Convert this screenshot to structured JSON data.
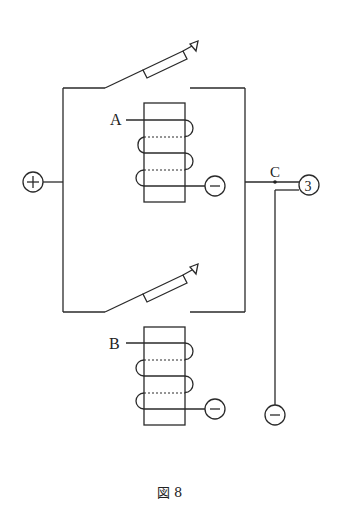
{
  "diagram": {
    "type": "relay switching circuit",
    "labels": {
      "coil_a": "A",
      "coil_b": "B",
      "junction": "C",
      "terminal_positive": "+",
      "terminal_negative": "−",
      "terminal_output": "3"
    },
    "caption": "図 8",
    "components": [
      {
        "id": "switch-top",
        "kind": "lever switch",
        "state": "open"
      },
      {
        "id": "switch-bottom",
        "kind": "lever switch",
        "state": "open"
      },
      {
        "id": "coil-a",
        "kind": "electromagnet coil",
        "label": "A",
        "turns": 3
      },
      {
        "id": "coil-b",
        "kind": "electromagnet coil",
        "label": "B",
        "turns": 3
      },
      {
        "id": "terminal-plus",
        "kind": "terminal",
        "symbol": "+"
      },
      {
        "id": "terminal-minus-a",
        "kind": "terminal",
        "symbol": "−"
      },
      {
        "id": "terminal-minus-b",
        "kind": "terminal",
        "symbol": "−"
      },
      {
        "id": "terminal-minus-c",
        "kind": "terminal",
        "symbol": "−"
      },
      {
        "id": "terminal-3",
        "kind": "terminal",
        "symbol": "3"
      },
      {
        "id": "junction-c",
        "kind": "node",
        "label": "C"
      }
    ]
  }
}
